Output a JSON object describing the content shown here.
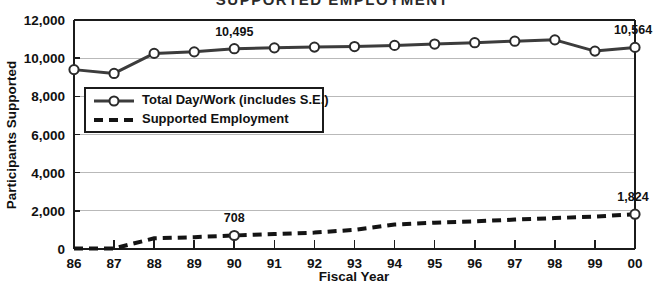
{
  "chart_title_partial": "SUPPORTED EMPLOYMENT",
  "axis": {
    "ylabel": "Participants Supported",
    "xlabel": "Fiscal Year"
  },
  "legend": {
    "item1": "Total Day/Work (includes S.E.)",
    "item2": "Supported Employment"
  },
  "annotations": {
    "total_1990": "10,495",
    "total_2000": "10,564",
    "se_1990": "708",
    "se_2000": "1,824"
  },
  "chart_data": {
    "type": "line",
    "title": "SUPPORTED EMPLOYMENT",
    "xlabel": "Fiscal Year",
    "ylabel": "Participants Supported",
    "ylim": [
      0,
      12000
    ],
    "yticks": [
      0,
      2000,
      4000,
      6000,
      8000,
      10000,
      12000
    ],
    "ytick_labels": [
      "0",
      "2,000",
      "4,000",
      "6,000",
      "8,000",
      "10,000",
      "12,000"
    ],
    "categories": [
      "86",
      "87",
      "88",
      "89",
      "90",
      "91",
      "92",
      "93",
      "94",
      "95",
      "96",
      "97",
      "98",
      "99",
      "00"
    ],
    "grid": true,
    "legend_position": "upper-left-inside",
    "series": [
      {
        "name": "Total Day/Work (includes S.E.)",
        "style": "solid-with-circle-markers",
        "color": "#3c3c3c",
        "values": [
          9400,
          9200,
          10250,
          10330,
          10495,
          10540,
          10580,
          10610,
          10670,
          10740,
          10810,
          10890,
          10960,
          10370,
          10564
        ]
      },
      {
        "name": "Supported Employment",
        "style": "dashed",
        "color": "#141414",
        "values": [
          20,
          30,
          560,
          620,
          708,
          780,
          860,
          1000,
          1280,
          1380,
          1450,
          1540,
          1620,
          1700,
          1824
        ]
      }
    ],
    "data_labels": [
      {
        "series": "Total Day/Work (includes S.E.)",
        "category": "90",
        "text": "10,495"
      },
      {
        "series": "Total Day/Work (includes S.E.)",
        "category": "00",
        "text": "10,564"
      },
      {
        "series": "Supported Employment",
        "category": "90",
        "text": "708"
      },
      {
        "series": "Supported Employment",
        "category": "00",
        "text": "1,824"
      }
    ]
  }
}
